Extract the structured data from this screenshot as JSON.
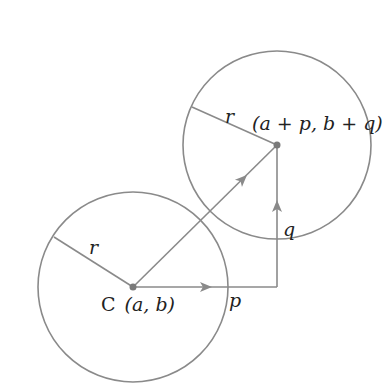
{
  "diagram": {
    "type": "circle-translation",
    "stroke_color": "#8a8a8a",
    "text_color": "#222222",
    "circle_original": {
      "center_label": "C (a, b)",
      "center_label_prefix": "C",
      "center_label_coords": "(a, b)",
      "radius_label": "r"
    },
    "circle_translated": {
      "center_label": "(a + p, b + q)",
      "radius_label": "r"
    },
    "vectors": {
      "horizontal_label": "p",
      "vertical_label": "q"
    }
  }
}
